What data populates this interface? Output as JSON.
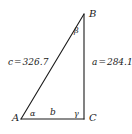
{
  "figure": {
    "type": "right-triangle-diagram",
    "background_color": "#ffffff",
    "stroke_color": "#1a1a1a"
  },
  "vertices": {
    "a": "A",
    "b": "B",
    "c": "C"
  },
  "angles": {
    "alpha": "α",
    "beta": "β",
    "gamma": "γ"
  },
  "sides": {
    "b_label": "b",
    "c_measure": {
      "name": "c",
      "equals": "=",
      "value": "326.7",
      "full": "c = 326.7"
    },
    "a_measure": {
      "name": "a",
      "equals": "=",
      "value": "284.1",
      "full": "a = 284.1"
    }
  },
  "geometry": {
    "point_a": {
      "x": 21,
      "y": 119
    },
    "point_b": {
      "x": 84,
      "y": 14
    },
    "point_c": {
      "x": 84,
      "y": 119
    }
  }
}
